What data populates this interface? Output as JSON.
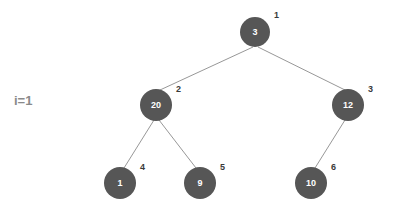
{
  "canvas": {
    "width": 394,
    "height": 213,
    "background": "#ffffff"
  },
  "iteration": {
    "label": "i=1",
    "x": 14,
    "y": 93,
    "color": "#8a8a8a"
  },
  "style": {
    "node_fill": "#565656",
    "node_text_color": "#ffffff",
    "index_text_color": "#3a3a3a",
    "edge_color": "#8b8b8b",
    "edge_width": 0.9
  },
  "chart_data": {
    "type": "diagram",
    "subtype": "binary-tree",
    "title": "i=1",
    "nodes": [
      {
        "index": "1",
        "value": "3",
        "cx": 255,
        "cy": 32,
        "r": 15,
        "index_x": 274,
        "index_y": 11
      },
      {
        "index": "2",
        "value": "20",
        "cx": 156,
        "cy": 105,
        "r": 16,
        "index_x": 176,
        "index_y": 85
      },
      {
        "index": "3",
        "value": "12",
        "cx": 348,
        "cy": 105,
        "r": 16,
        "index_x": 368,
        "index_y": 85
      },
      {
        "index": "4",
        "value": "1",
        "cx": 120,
        "cy": 183,
        "r": 16,
        "index_x": 140,
        "index_y": 163
      },
      {
        "index": "5",
        "value": "9",
        "cx": 200,
        "cy": 183,
        "r": 16,
        "index_x": 220,
        "index_y": 163
      },
      {
        "index": "6",
        "value": "10",
        "cx": 311,
        "cy": 183,
        "r": 16,
        "index_x": 331,
        "index_y": 163
      }
    ],
    "edges": [
      {
        "from": "1",
        "to": "2",
        "x1": 253,
        "y1": 47,
        "x2": 160,
        "y2": 90
      },
      {
        "from": "1",
        "to": "3",
        "x1": 258,
        "y1": 47,
        "x2": 345,
        "y2": 90
      },
      {
        "from": "2",
        "to": "4",
        "x1": 154,
        "y1": 120,
        "x2": 124,
        "y2": 168
      },
      {
        "from": "2",
        "to": "5",
        "x1": 159,
        "y1": 120,
        "x2": 196,
        "y2": 168
      },
      {
        "from": "3",
        "to": "6",
        "x1": 345,
        "y1": 120,
        "x2": 315,
        "y2": 168
      }
    ]
  }
}
